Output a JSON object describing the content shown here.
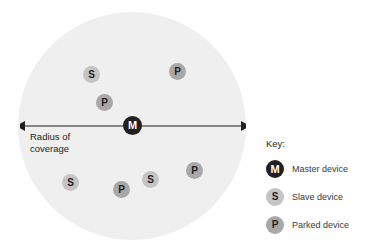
{
  "diagram": {
    "coverage": {
      "name": "coverage-area",
      "fill_color": "#efefef",
      "center_x": 132,
      "center_y": 126,
      "radius": 114
    },
    "radius_arrow": {
      "label_line1": "Radius of",
      "label_line2": "coverage",
      "label_full": "Radius of coverage",
      "color": "#231f20",
      "from_x": 20,
      "to_x": 246,
      "y": 126
    },
    "nodes": [
      {
        "id": "node-slave-1",
        "letter": "S",
        "type": "slave",
        "x": 92,
        "y": 75,
        "color": "#c4c4c4"
      },
      {
        "id": "node-parked-1",
        "letter": "P",
        "type": "parked",
        "x": 178,
        "y": 72,
        "color": "#a8a8a8"
      },
      {
        "id": "node-parked-2",
        "letter": "P",
        "type": "parked",
        "x": 105,
        "y": 103,
        "color": "#a8a8a8"
      },
      {
        "id": "node-master",
        "letter": "M",
        "type": "master",
        "x": 133,
        "y": 126,
        "color": "#231f20"
      },
      {
        "id": "node-slave-2",
        "letter": "S",
        "type": "slave",
        "x": 71,
        "y": 183,
        "color": "#c4c4c4"
      },
      {
        "id": "node-parked-3",
        "letter": "P",
        "type": "parked",
        "x": 122,
        "y": 190,
        "color": "#a8a8a8"
      },
      {
        "id": "node-slave-3",
        "letter": "S",
        "type": "slave",
        "x": 151,
        "y": 180,
        "color": "#c4c4c4"
      },
      {
        "id": "node-parked-4",
        "letter": "P",
        "type": "parked",
        "x": 195,
        "y": 171,
        "color": "#a8a8a8"
      }
    ]
  },
  "key": {
    "title": "Key:",
    "items": [
      {
        "letter": "M",
        "label": "Master device",
        "color": "#231f20"
      },
      {
        "letter": "S",
        "label": "Slave device",
        "color": "#c4c4c4"
      },
      {
        "letter": "P",
        "label": "Parked device",
        "color": "#a8a8a8"
      }
    ]
  }
}
